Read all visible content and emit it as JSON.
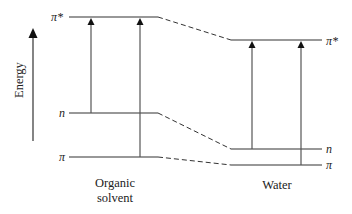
{
  "diagram": {
    "type": "energy-level-diagram",
    "axis": {
      "label": "Energy",
      "direction": "up"
    },
    "columns": [
      {
        "id": "organic",
        "caption_line1": "Organic",
        "caption_line2": "solvent",
        "levels": [
          {
            "id": "pi_star",
            "label": "π*",
            "y": 17
          },
          {
            "id": "n",
            "label": "n",
            "y": 113
          },
          {
            "id": "pi",
            "label": "π",
            "y": 157
          }
        ],
        "transitions": [
          {
            "from": "n",
            "to": "pi_star"
          },
          {
            "from": "pi",
            "to": "pi_star"
          }
        ]
      },
      {
        "id": "water",
        "caption_line1": "Water",
        "levels": [
          {
            "id": "pi_star",
            "label": "π*",
            "y": 40
          },
          {
            "id": "n",
            "label": "n",
            "y": 149
          },
          {
            "id": "pi",
            "label": "π",
            "y": 165
          }
        ],
        "transitions": [
          {
            "from": "n",
            "to": "pi_star"
          },
          {
            "from": "pi",
            "to": "pi_star"
          }
        ]
      }
    ],
    "connectors": [
      {
        "level": "pi_star",
        "style": "dashed"
      },
      {
        "level": "n",
        "style": "dashed"
      },
      {
        "level": "pi",
        "style": "dashed"
      }
    ],
    "colors": {
      "line": "#333333",
      "arrow": "#555555",
      "background": "#ffffff"
    }
  }
}
